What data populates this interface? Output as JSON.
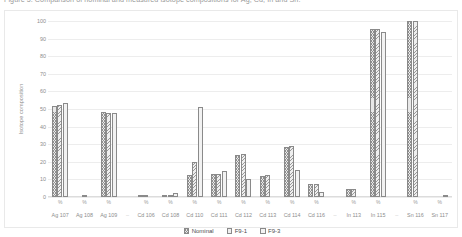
{
  "caption": {
    "text": "Figure 5. Comparison of nominal and measured isotope compositions for Ag, Cd, In and Sn."
  },
  "chart_data": {
    "type": "bar",
    "title": "",
    "xlabel": "",
    "ylabel": "Isotope composition",
    "ylim": [
      0,
      100
    ],
    "yticks": [
      0,
      10,
      20,
      30,
      40,
      50,
      60,
      70,
      80,
      90,
      100
    ],
    "grid": true,
    "legend_position": "bottom",
    "unit_label": "%",
    "element_groups": [
      {
        "element": "Ag",
        "categories": [
          "Ag 107",
          "Ag 108",
          "Ag 109"
        ]
      },
      {
        "element": "Cd",
        "categories": [
          "Cd 106",
          "Cd 108",
          "Cd 110",
          "Cd 111",
          "Cd 112",
          "Cd 113",
          "Cd 114",
          "Cd 116"
        ]
      },
      {
        "element": "In",
        "categories": [
          "In 113",
          "In 115"
        ]
      },
      {
        "element": "Sn",
        "categories": [
          "Sn 116",
          "Sn 117"
        ]
      }
    ],
    "categories": [
      "Ag 107",
      "Ag 108",
      "Ag 109",
      "Cd 106",
      "Cd 108",
      "Cd 110",
      "Cd 111",
      "Cd 112",
      "Cd 113",
      "Cd 114",
      "Cd 116",
      "In 113",
      "In 115",
      "Sn 116",
      "Sn 117"
    ],
    "series": [
      {
        "name": "Nominal",
        "values": [
          51.8,
          0.0,
          48.2,
          1.2,
          0.9,
          12.5,
          12.8,
          24.1,
          12.2,
          28.7,
          7.5,
          4.3,
          95.7,
          100.0,
          0.0
        ]
      },
      {
        "name": "F9-1",
        "values": [
          52.0,
          0.7,
          48.0,
          1.4,
          1.1,
          20.0,
          13.0,
          24.3,
          12.4,
          28.9,
          7.6,
          4.5,
          95.5,
          99.8,
          0.0
        ]
      },
      {
        "name": "F9-3",
        "values": [
          53.5,
          0.0,
          47.5,
          0.0,
          2.5,
          51.0,
          14.5,
          10.2,
          0.0,
          15.5,
          3.0,
          0.0,
          94.0,
          0.0,
          0.8
        ]
      }
    ],
    "legend": [
      "Nominal",
      "F9-1",
      "F9-3"
    ],
    "separator_glyph": "–"
  }
}
